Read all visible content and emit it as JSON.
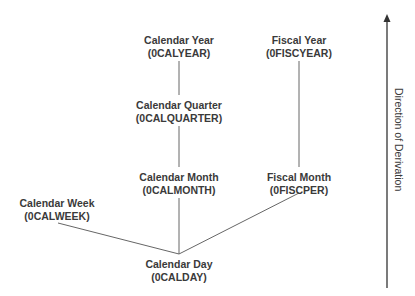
{
  "nodes": [
    {
      "id": "calyear",
      "name": "Calendar Year",
      "code": "(0CALYEAR)",
      "x": 179,
      "y": 34
    },
    {
      "id": "fiscyear",
      "name": "Fiscal Year",
      "code": "(0FISCYEAR)",
      "x": 299,
      "y": 34
    },
    {
      "id": "calquarter",
      "name": "Calendar Quarter",
      "code": "(0CALQUARTER)",
      "x": 179,
      "y": 99
    },
    {
      "id": "calmonth",
      "name": "Calendar Month",
      "code": "(0CALMONTH)",
      "x": 179,
      "y": 171
    },
    {
      "id": "fiscper",
      "name": "Fiscal Month",
      "code": "(0FISCPER)",
      "x": 299,
      "y": 171
    },
    {
      "id": "calweek",
      "name": "Calendar Week",
      "code": "(0CALWEEK)",
      "x": 57,
      "y": 197
    },
    {
      "id": "calday",
      "name": "Calendar Day",
      "code": "(0CALDAY)",
      "x": 179,
      "y": 258
    }
  ],
  "axis": {
    "label": "Direction of Derivation",
    "color": "#3a3a3a"
  },
  "line_color": "#555555"
}
